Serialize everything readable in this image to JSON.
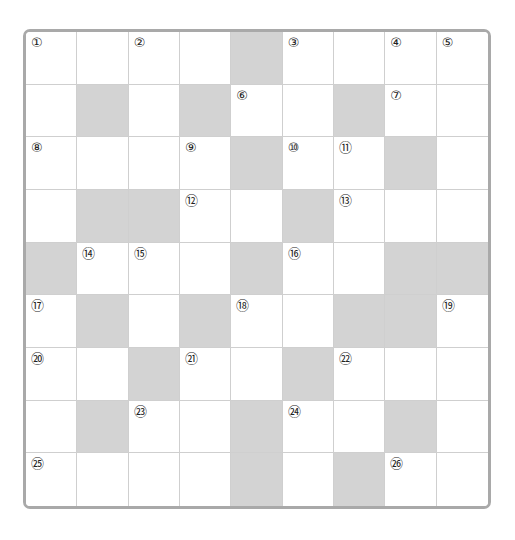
{
  "puzzle": {
    "type": "crossword",
    "rows": 9,
    "cols": 9,
    "colors": {
      "block": "#d3d3d3",
      "border": "#a9a9a9",
      "gridline": "#cfcfcf",
      "cell": "#ffffff"
    },
    "grid": [
      [
        "①",
        "",
        "②",
        "",
        "#",
        "③",
        "",
        "④",
        "⑤"
      ],
      [
        "",
        "#",
        "",
        "#",
        "⑥",
        "",
        "#",
        "⑦",
        ""
      ],
      [
        "⑧",
        "",
        "",
        "⑨",
        "#",
        "⑩",
        "⑪",
        "#",
        ""
      ],
      [
        "",
        "#",
        "#",
        "⑫",
        "",
        "#",
        "⑬",
        "",
        ""
      ],
      [
        "#",
        "⑭",
        "⑮",
        "",
        "#",
        "⑯",
        "",
        "#",
        "#"
      ],
      [
        "⑰",
        "#",
        "",
        "#",
        "⑱",
        "",
        "#",
        "#",
        "⑲"
      ],
      [
        "⑳",
        "",
        "#",
        "㉑",
        "",
        "#",
        "㉒",
        "",
        ""
      ],
      [
        "",
        "#",
        "㉓",
        "",
        "#",
        "㉔",
        "",
        "#",
        ""
      ],
      [
        "㉕",
        "",
        "",
        "",
        "#",
        "",
        "#",
        "㉖",
        ""
      ]
    ]
  }
}
